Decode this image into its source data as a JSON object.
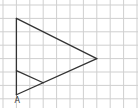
{
  "diagram": {
    "type": "grid-geometry",
    "grid": {
      "columns": 10,
      "rows": 8
    },
    "colors": {
      "grid": "#cfcfcf",
      "lines": "#333333",
      "background": "#ffffff"
    },
    "points": {
      "A": {
        "label": "A",
        "col": 1,
        "row": 6.7
      },
      "top": {
        "col": 1,
        "row": 1
      },
      "right": {
        "col": 7,
        "row": 4
      },
      "inner_left": {
        "col": 1,
        "row": 4.9
      },
      "inner_right": {
        "col": 3,
        "row": 5.8
      }
    },
    "segments": [
      {
        "name": "left-side",
        "from": "A",
        "to": "top"
      },
      {
        "name": "upper-side",
        "from": "top",
        "to": "right"
      },
      {
        "name": "lower-side",
        "from": "right",
        "to": "A"
      },
      {
        "name": "inner-segment",
        "from": "inner_left",
        "to": "inner_right"
      }
    ],
    "labels": [
      {
        "text": "A",
        "at": "A"
      }
    ]
  }
}
